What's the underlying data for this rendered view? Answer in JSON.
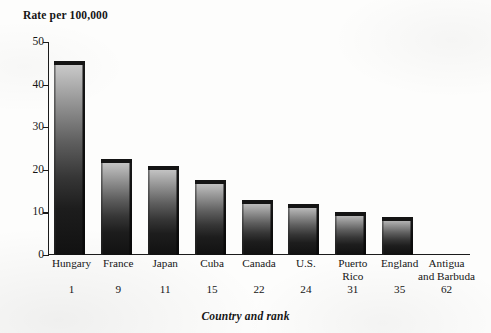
{
  "chart_data": {
    "type": "bar",
    "title": "",
    "ylabel": "Rate per 100,000",
    "xlabel": "Country and rank",
    "ylim": [
      0,
      50
    ],
    "yticks": [
      0,
      10,
      20,
      30,
      40,
      50
    ],
    "ytick_labels": [
      "0",
      "10",
      "20",
      "30",
      "40",
      "50"
    ],
    "grid": false,
    "legend": "none",
    "categories": [
      "Hungary",
      "France",
      "Japan",
      "Cuba",
      "Canada",
      "U.S.",
      "Puerto\nRico",
      "England",
      "Antigua\nand Barbuda"
    ],
    "ranks": [
      "1",
      "9",
      "11",
      "15",
      "22",
      "24",
      "31",
      "35",
      "62"
    ],
    "values": [
      45.5,
      22.5,
      21,
      17.5,
      13,
      12,
      10,
      9,
      0
    ],
    "bar_style": "3d-beveled-gradient",
    "bar_color": "#1d1d1d"
  },
  "axis": {
    "y_title": "Rate per 100,000",
    "x_title": "Country and rank"
  }
}
